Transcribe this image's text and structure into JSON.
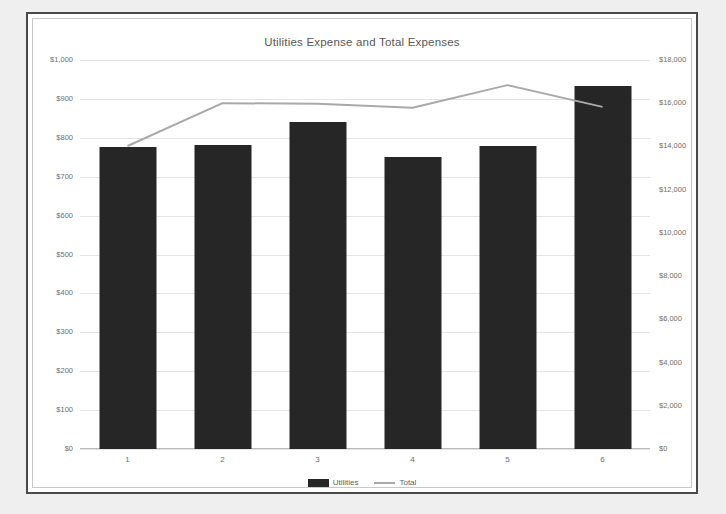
{
  "chart_data": {
    "type": "bar",
    "title": "Utilities Expense and Total Expenses",
    "xlabel": "",
    "ylabel": "",
    "categories": [
      "1",
      "2",
      "3",
      "4",
      "5",
      "6"
    ],
    "grid": true,
    "legend_position": "bottom",
    "series": [
      {
        "name": "Utilities",
        "type": "bar",
        "axis": "left",
        "color": "#262626",
        "values": [
          776,
          781,
          840,
          751,
          779,
          933
        ]
      },
      {
        "name": "Total",
        "type": "line",
        "axis": "right",
        "color": "#a9a9a9",
        "values": [
          14020,
          16000,
          15980,
          15790,
          16840,
          15830
        ]
      }
    ],
    "left_axis": {
      "min": 0,
      "max": 1000,
      "step": 100,
      "ticks": [
        "$0",
        "$100",
        "$200",
        "$300",
        "$400",
        "$500",
        "$600",
        "$700",
        "$800",
        "$900",
        "$1,000"
      ]
    },
    "right_axis": {
      "min": 0,
      "max": 18000,
      "step": 2000,
      "ticks": [
        "$0",
        "$2,000",
        "$4,000",
        "$6,000",
        "$8,000",
        "$10,000",
        "$12,000",
        "$14,000",
        "$16,000",
        "$18,000"
      ]
    }
  }
}
